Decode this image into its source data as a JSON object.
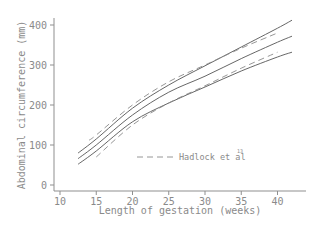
{
  "chart_data": {
    "type": "line",
    "title": "",
    "xlabel": "Length of gestation (weeks)",
    "ylabel": "Abdominal circumference (mm)",
    "xlim": [
      9,
      44
    ],
    "ylim": [
      -5,
      440
    ],
    "xticks": [
      10,
      15,
      20,
      25,
      30,
      35,
      40
    ],
    "yticks": [
      0,
      100,
      200,
      300,
      400
    ],
    "grid": false,
    "legend": {
      "position": "inside-lower-right",
      "entries": [
        {
          "label": "Hadlock et al",
          "superscript": "13",
          "style": "dashed"
        }
      ]
    },
    "series": [
      {
        "name": "Upper centile",
        "style": "solid",
        "x": [
          12.5,
          15,
          20,
          25,
          30,
          35,
          40,
          42
        ],
        "y": [
          80,
          115,
          192,
          250,
          298,
          345,
          392,
          412
        ]
      },
      {
        "name": "Median",
        "style": "solid",
        "x": [
          12.5,
          15,
          20,
          25,
          30,
          35,
          40,
          42
        ],
        "y": [
          66,
          100,
          175,
          232,
          272,
          316,
          357,
          372
        ]
      },
      {
        "name": "Lower centile",
        "style": "solid",
        "x": [
          12.5,
          15,
          20,
          25,
          30,
          35,
          40,
          42
        ],
        "y": [
          52,
          85,
          158,
          205,
          245,
          285,
          320,
          332
        ]
      },
      {
        "name": "Hadlock et al upper",
        "style": "dashed",
        "x": [
          14,
          15,
          20,
          25,
          30,
          35,
          40
        ],
        "y": [
          112,
          125,
          200,
          258,
          300,
          342,
          380
        ]
      },
      {
        "name": "Hadlock et al lower",
        "style": "dashed",
        "x": [
          15,
          20,
          25,
          30,
          35,
          40
        ],
        "y": [
          70,
          150,
          205,
          248,
          292,
          332
        ]
      }
    ]
  },
  "axes": {
    "xlabel": "Length of gestation (weeks)",
    "ylabel": "Abdominal circumference (mm)",
    "xtick_labels": [
      "10",
      "15",
      "20",
      "25",
      "30",
      "35",
      "40"
    ],
    "ytick_labels": [
      "0",
      "100",
      "200",
      "300",
      "400"
    ]
  },
  "legend": {
    "label": "Hadlock et al",
    "superscript": "13"
  }
}
